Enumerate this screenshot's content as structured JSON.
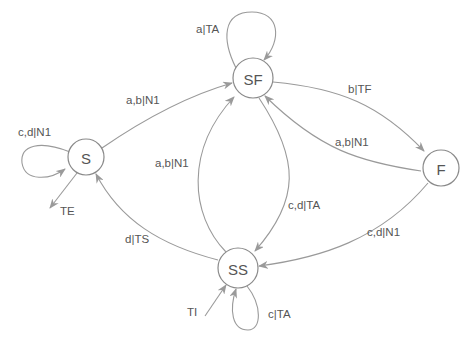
{
  "diagram": {
    "type": "state-machine",
    "states": [
      {
        "id": "SF",
        "label": "SF"
      },
      {
        "id": "S",
        "label": "S"
      },
      {
        "id": "F",
        "label": "F"
      },
      {
        "id": "SS",
        "label": "SS"
      }
    ],
    "transitions": [
      {
        "from": "SF",
        "to": "SF",
        "label": "a|TA"
      },
      {
        "from": "S",
        "to": "SF",
        "label": "a,b|N1"
      },
      {
        "from": "S",
        "to": "S",
        "label": "c,d|N1"
      },
      {
        "from": "S",
        "to": "external",
        "label": "TE"
      },
      {
        "from": "SF",
        "to": "F",
        "label": "b|TF"
      },
      {
        "from": "F",
        "to": "SF",
        "label": "a,b|N1"
      },
      {
        "from": "SS",
        "to": "SF",
        "label": "a,b|N1"
      },
      {
        "from": "SF",
        "to": "SS",
        "label": "c,d|TA"
      },
      {
        "from": "F",
        "to": "SS",
        "label": "c,d|N1"
      },
      {
        "from": "SS",
        "to": "S",
        "label": "d|TS"
      },
      {
        "from": "external",
        "to": "SS",
        "label": "TI"
      },
      {
        "from": "SS",
        "to": "SS",
        "label": "c|TA"
      }
    ]
  },
  "labels": {
    "sf_loop": "a|TA",
    "s_to_sf": "a,b|N1",
    "s_loop": "c,d|N1",
    "s_exit": "TE",
    "sf_to_f": "b|TF",
    "f_to_sf": "a,b|N1",
    "ss_to_sf": "a,b|N1",
    "sf_to_ss": "c,d|TA",
    "f_to_ss": "c,d|N1",
    "ss_to_s": "d|TS",
    "ss_entry": "TI",
    "ss_loop": "c|TA"
  },
  "colors": {
    "stroke": "#9a9a9a",
    "text": "#555555",
    "background": "#ffffff"
  }
}
